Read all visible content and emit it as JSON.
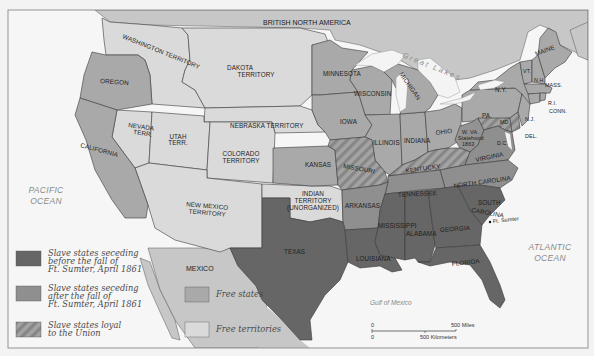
{
  "map": {
    "title_partial": "THE UNITED STATES",
    "colors": {
      "background": "#f3f3f3",
      "ocean": "#f6f6f6",
      "foreign_land": "#c7c7c7",
      "free_territories": "#dadada",
      "free_states": "#a9a9a9",
      "slave_after": "#8f8f8f",
      "slave_before": "#666666",
      "loyal_hatch_a": "#a3a3a3",
      "loyal_hatch_b": "#878787",
      "lakes": "#f4f4f4",
      "frame": "#8a8a8a"
    },
    "regions": {
      "british_north_america": "BRITISH NORTH AMERICA",
      "mexico": "MEXICO",
      "pacific": [
        "PACIFIC",
        "OCEAN"
      ],
      "atlantic": [
        "ATLANTIC",
        "OCEAN"
      ],
      "gulf": "Gulf of Mexico",
      "great_lakes": "Great Lakes"
    },
    "territories": {
      "washington": "WASHINGTON TERRITORY",
      "dakota": [
        "DAKOTA",
        "TERRITORY"
      ],
      "nebraska": "NEBRASKA TERRITORY",
      "nevada": [
        "NEVADA",
        "TERR."
      ],
      "utah": [
        "UTAH",
        "TERR."
      ],
      "colorado": [
        "COLORADO",
        "TERRITORY"
      ],
      "new_mexico": [
        "NEW MEXICO",
        "TERRITORY"
      ],
      "indian": [
        "INDIAN",
        "TERRITORY",
        "(UNORGANIZED)"
      ]
    },
    "free_states": {
      "oregon": "OREGON",
      "california": "CALIFORNIA",
      "minnesota": "MINNESOTA",
      "wisconsin": "WISCONSIN",
      "michigan": "MICHIGAN",
      "iowa": "IOWA",
      "kansas": "KANSAS",
      "illinois": "ILLINOIS",
      "indiana": "INDIANA",
      "ohio": "OHIO",
      "pa": "PA.",
      "ny": "N.Y.",
      "vt": "VT.",
      "nh": "N.H.",
      "maine": "MAINE",
      "mass": "MASS.",
      "ri": "R.I.",
      "conn": "CONN.",
      "nj": "N.J.",
      "wva": [
        "W. VA.",
        "Statehood",
        "1863"
      ]
    },
    "slave_states_before": {
      "texas": "TEXAS",
      "louisiana": "LOUISIANA",
      "mississippi": "MISSISSIPPI",
      "alabama": "ALABAMA",
      "georgia": "GEORGIA",
      "florida": "FLORIDA",
      "south_carolina": [
        "SOUTH",
        "CAROLINA"
      ]
    },
    "slave_states_after": {
      "arkansas": "ARKANSAS",
      "tennessee": "TENNESSEE",
      "north_carolina": "NORTH CAROLINA",
      "virginia": "VIRGINIA"
    },
    "slave_states_loyal": {
      "missouri": "MISSOURI",
      "kentucky": "KENTUCKY",
      "md": "MD.",
      "del": "DEL.",
      "dc": "D.C."
    },
    "places": {
      "ft_sumter": "Ft. Sumter"
    }
  },
  "legend": {
    "items": [
      {
        "key": "slave_before",
        "lines": [
          "Slave states seceding",
          "before the fall of",
          "Ft. Sumter, April 1861"
        ]
      },
      {
        "key": "slave_after",
        "lines": [
          "Slave states seceding",
          "after the fall of",
          "Ft. Sumter, April 1861"
        ]
      },
      {
        "key": "slave_loyal",
        "lines": [
          "Slave states loyal",
          "to the Union"
        ]
      },
      {
        "key": "free_states",
        "lines": [
          "Free states"
        ]
      },
      {
        "key": "free_territories",
        "lines": [
          "Free territories"
        ]
      }
    ]
  },
  "scale": {
    "zero_top": "0",
    "miles": "500 Miles",
    "zero_bottom": "0",
    "kilometers": "500 Kilometers"
  }
}
